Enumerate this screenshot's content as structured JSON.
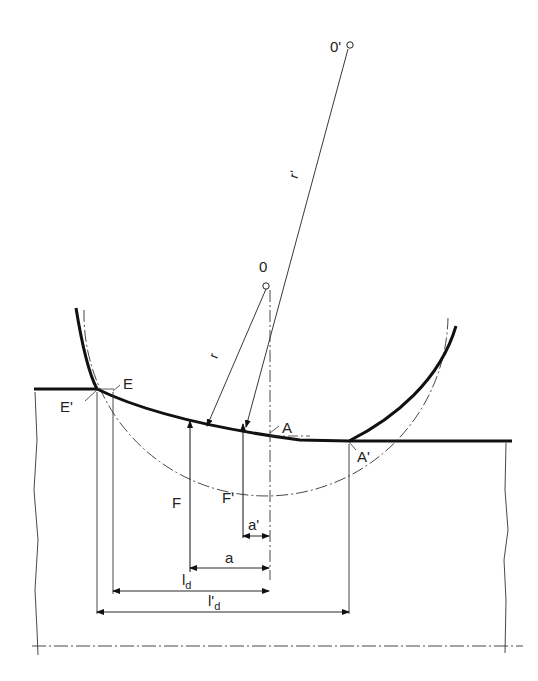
{
  "diagram": {
    "type": "technical-drawing",
    "colors": {
      "ink": "#111111",
      "background": "#ffffff"
    },
    "points": {
      "O": {
        "label": "0",
        "x": 266,
        "y": 286
      },
      "O_prime": {
        "label": "0'",
        "x": 349,
        "y": 45
      },
      "E": {
        "label": "E",
        "x": 113,
        "y": 393
      },
      "E_prime": {
        "label": "E'",
        "x": 97,
        "y": 389
      },
      "A": {
        "label": "A",
        "x": 270,
        "y": 434
      },
      "A_prime": {
        "label": "A'",
        "x": 349,
        "y": 441
      }
    },
    "radii": {
      "r": {
        "label": "r"
      },
      "r_prime": {
        "label": "r'"
      }
    },
    "forces": {
      "F": {
        "label": "F"
      },
      "F_prime": {
        "label": "F'"
      }
    },
    "dimensions": {
      "a": {
        "label": "a"
      },
      "a_prime": {
        "label": "a'"
      },
      "l_d": {
        "label": "l",
        "subscript": "d"
      },
      "l_prime_d": {
        "label": "l'",
        "subscript": "d"
      }
    }
  }
}
